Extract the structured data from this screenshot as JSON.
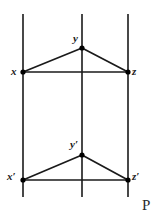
{
  "figure": {
    "width": 163,
    "height": 220,
    "background_color": "#ffffff",
    "stroke_color": "#1a1a1a",
    "vertex_color": "#000000",
    "plane_label": "P",
    "labels": {
      "x": "x",
      "y": "y",
      "z": "z",
      "x_prime": "x′",
      "y_prime": "y′",
      "z_prime": "z′"
    },
    "vertical_lines": [
      {
        "name": "left-vertical-line",
        "x": 23,
        "y_top": 14,
        "y_bottom": 197
      },
      {
        "name": "middle-vertical-line",
        "x": 82,
        "y_top": 14,
        "y_bottom": 197
      },
      {
        "name": "right-vertical-line",
        "x": 128,
        "y_top": 14,
        "y_bottom": 197
      }
    ],
    "points": [
      {
        "name": "x",
        "cx": 23,
        "cy": 72
      },
      {
        "name": "y",
        "cx": 82,
        "cy": 48
      },
      {
        "name": "z",
        "cx": 128,
        "cy": 72
      },
      {
        "name": "x'",
        "cx": 23,
        "cy": 180
      },
      {
        "name": "y'",
        "cx": 82,
        "cy": 155
      },
      {
        "name": "z'",
        "cx": 128,
        "cy": 180
      }
    ],
    "segments": [
      {
        "name": "segment-x-y",
        "x1": 23,
        "y1": 72,
        "x2": 82,
        "y2": 48
      },
      {
        "name": "segment-y-z",
        "x1": 82,
        "y1": 48,
        "x2": 128,
        "y2": 72
      },
      {
        "name": "segment-x-z",
        "x1": 23,
        "y1": 72,
        "x2": 128,
        "y2": 72
      },
      {
        "name": "segment-xp-yp",
        "x1": 23,
        "y1": 180,
        "x2": 82,
        "y2": 155
      },
      {
        "name": "segment-yp-zp",
        "x1": 82,
        "y1": 155,
        "x2": 128,
        "y2": 180
      },
      {
        "name": "segment-xp-zp",
        "x1": 23,
        "y1": 180,
        "x2": 128,
        "y2": 180
      }
    ]
  }
}
